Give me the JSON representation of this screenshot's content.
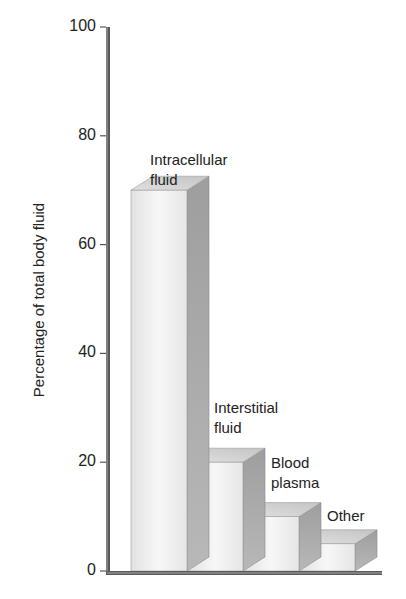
{
  "chart_data": {
    "type": "bar",
    "title": "",
    "xlabel": "",
    "ylabel": "Percentage of total body fluid",
    "ylim": [
      0,
      100
    ],
    "yticks": [
      0,
      20,
      40,
      60,
      80,
      100
    ],
    "grid": false,
    "legend": null,
    "style": "3d-stepped",
    "categories": [
      "Intracellular fluid",
      "Interstitial fluid",
      "Blood plasma",
      "Other"
    ],
    "values": [
      70,
      20,
      10,
      5
    ]
  },
  "labels": {
    "ylabel": "Percentage of total body fluid",
    "ticks": [
      "0",
      "20",
      "40",
      "60",
      "80",
      "100"
    ],
    "bars": [
      "Intracellular\nfluid",
      "Interstitial\nfluid",
      "Blood\nplasma",
      "Other"
    ]
  },
  "colors": {
    "axis": "#555555",
    "bar_front": "#efefef",
    "bar_top": "#d6d6d6",
    "bar_side": "#a9a9a9",
    "text": "#222222"
  }
}
